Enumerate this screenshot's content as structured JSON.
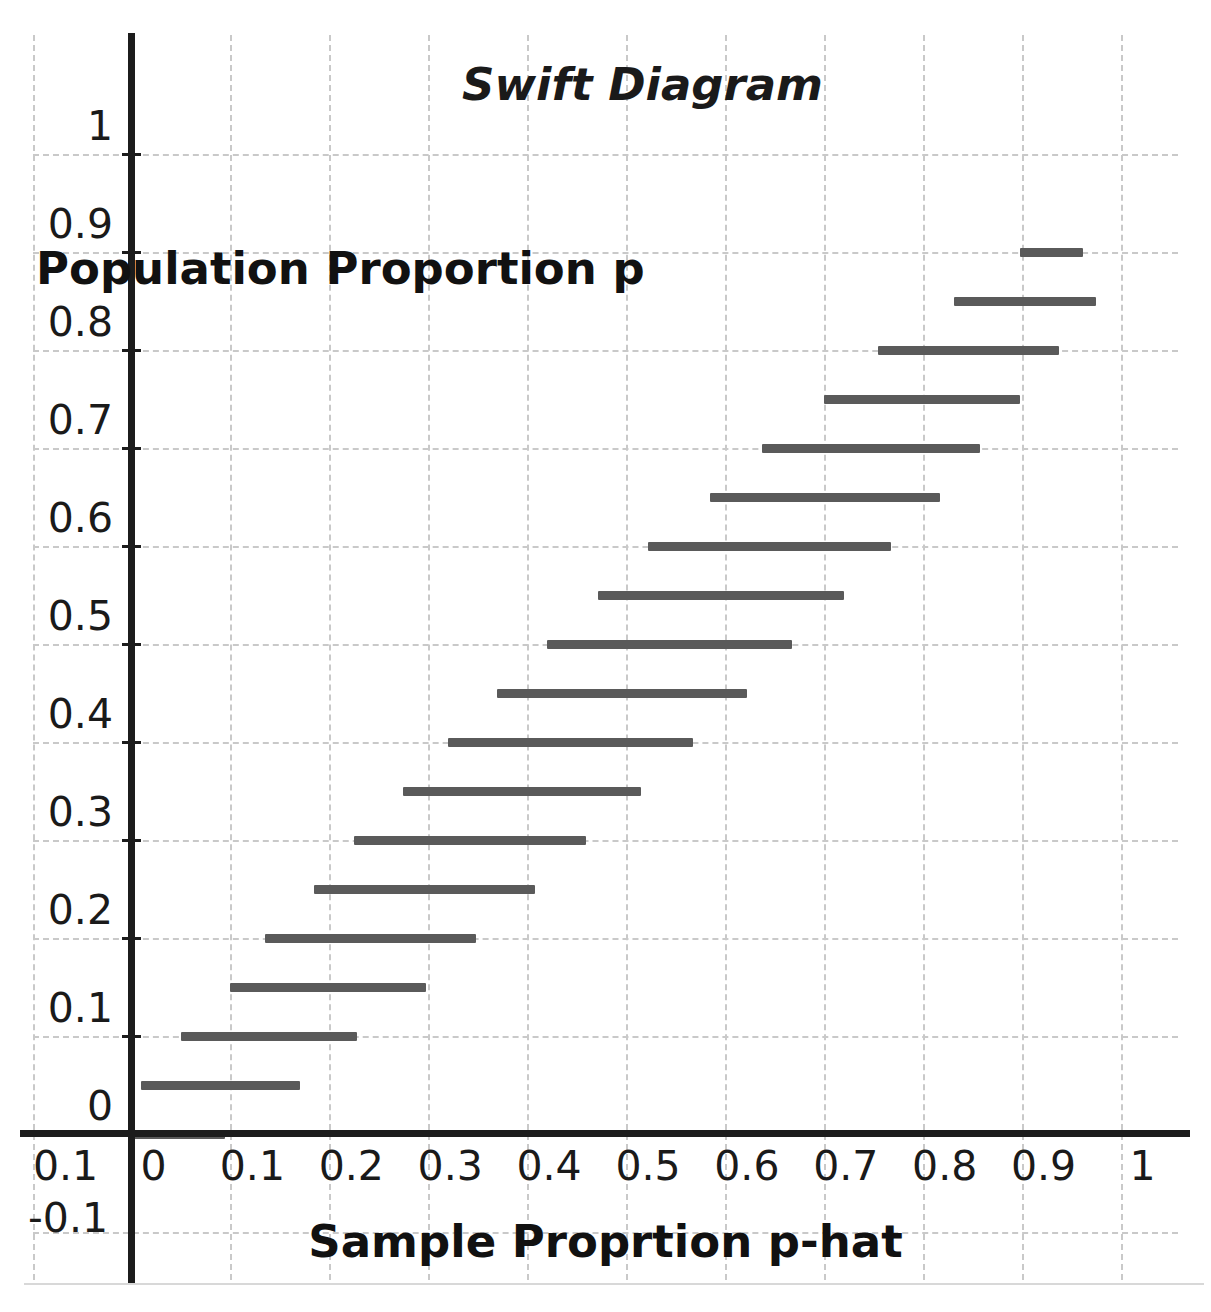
{
  "chart_data": {
    "type": "line",
    "title": "Swift Diagram",
    "xlabel": "Sample Proprtion p-hat",
    "ylabel": "Population Proportion p",
    "xlim": [
      -0.1,
      1.06
    ],
    "ylim": [
      -0.1,
      1.06
    ],
    "grid": true,
    "legend": "none",
    "x_ticks": [
      "0",
      "0.1",
      "0.2",
      "0.3",
      "0.4",
      "0.5",
      "0.6",
      "0.7",
      "0.8",
      "0.9",
      "1"
    ],
    "x_tick_values": [
      0,
      0.1,
      0.2,
      0.3,
      0.4,
      0.5,
      0.6,
      0.7,
      0.8,
      0.9,
      1
    ],
    "y_ticks": [
      "0",
      "0.1",
      "0.2",
      "0.3",
      "0.4",
      "0.5",
      "0.6",
      "0.7",
      "0.8",
      "0.9",
      "1"
    ],
    "y_tick_values": [
      0,
      0.1,
      0.2,
      0.3,
      0.4,
      0.5,
      0.6,
      0.7,
      0.8,
      0.9,
      1
    ],
    "extra_axis_labels": {
      "x_negative": "0.1",
      "y_negative": "-0.1"
    },
    "series_name": "Confidence interval for p-hat at each p",
    "segment_color": "#5a5a5a",
    "intervals": [
      {
        "p": 0.0,
        "x_low": 0.0,
        "x_high": 0.095
      },
      {
        "p": 0.05,
        "x_low": 0.01,
        "x_high": 0.17
      },
      {
        "p": 0.1,
        "x_low": 0.05,
        "x_high": 0.228
      },
      {
        "p": 0.15,
        "x_low": 0.1,
        "x_high": 0.298
      },
      {
        "p": 0.2,
        "x_low": 0.135,
        "x_high": 0.348
      },
      {
        "p": 0.25,
        "x_low": 0.185,
        "x_high": 0.408
      },
      {
        "p": 0.3,
        "x_low": 0.225,
        "x_high": 0.46
      },
      {
        "p": 0.35,
        "x_low": 0.275,
        "x_high": 0.515
      },
      {
        "p": 0.4,
        "x_low": 0.32,
        "x_high": 0.568
      },
      {
        "p": 0.45,
        "x_low": 0.37,
        "x_high": 0.622
      },
      {
        "p": 0.5,
        "x_low": 0.42,
        "x_high": 0.668
      },
      {
        "p": 0.55,
        "x_low": 0.472,
        "x_high": 0.72
      },
      {
        "p": 0.6,
        "x_low": 0.522,
        "x_high": 0.768
      },
      {
        "p": 0.65,
        "x_low": 0.585,
        "x_high": 0.818
      },
      {
        "p": 0.7,
        "x_low": 0.638,
        "x_high": 0.858
      },
      {
        "p": 0.75,
        "x_low": 0.7,
        "x_high": 0.898
      },
      {
        "p": 0.8,
        "x_low": 0.755,
        "x_high": 0.938
      },
      {
        "p": 0.85,
        "x_low": 0.832,
        "x_high": 0.975
      },
      {
        "p": 0.9,
        "x_low": 0.898,
        "x_high": 0.962
      }
    ]
  }
}
